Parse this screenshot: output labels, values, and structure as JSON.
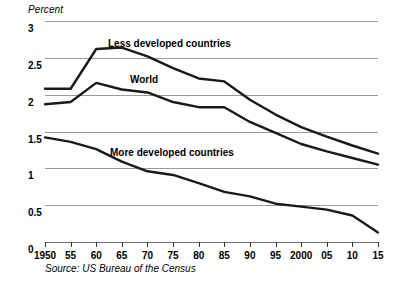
{
  "axis": {
    "y_title": "Percent",
    "y_ticks": [
      "3",
      "2.5",
      "2",
      "1.5",
      "1",
      "0.5",
      "0"
    ],
    "x_ticks": [
      "1950",
      "55",
      "60",
      "65",
      "70",
      "75",
      "80",
      "85",
      "90",
      "95",
      "2000",
      "05",
      "10",
      "15"
    ]
  },
  "labels": {
    "less_developed": "Less developed countries",
    "world": "World",
    "more_developed": "More developed countries"
  },
  "source": "Source: US Bureau of the Census",
  "chart_data": {
    "type": "line",
    "title": "",
    "subtitle": "",
    "xlabel": "",
    "ylabel": "Percent",
    "ylim": [
      0,
      3
    ],
    "xlim": [
      1950,
      2015
    ],
    "grid": true,
    "legend": "inline-annotations",
    "x": [
      1950,
      1955,
      1960,
      1965,
      1970,
      1975,
      1980,
      1985,
      1990,
      1995,
      2000,
      2005,
      2010,
      2015
    ],
    "series": [
      {
        "name": "Less developed countries",
        "color": "#1a1a1a",
        "values": [
          2.08,
          2.08,
          2.62,
          2.64,
          2.52,
          2.36,
          2.22,
          2.18,
          1.93,
          1.73,
          1.56,
          1.43,
          1.31,
          1.2
        ]
      },
      {
        "name": "World",
        "color": "#1a1a1a",
        "values": [
          1.87,
          1.9,
          2.16,
          2.07,
          2.03,
          1.9,
          1.83,
          1.83,
          1.63,
          1.48,
          1.33,
          1.23,
          1.14,
          1.05
        ]
      },
      {
        "name": "More developed countries",
        "color": "#1a1a1a",
        "values": [
          1.42,
          1.36,
          1.26,
          1.09,
          0.96,
          0.91,
          0.8,
          0.68,
          0.62,
          0.52,
          0.48,
          0.44,
          0.36,
          0.13
        ]
      }
    ]
  }
}
